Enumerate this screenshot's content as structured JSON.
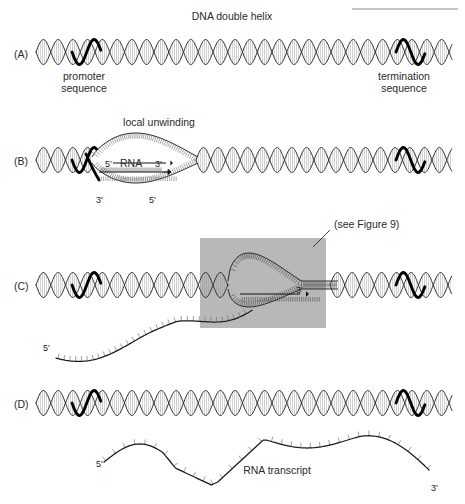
{
  "figure": {
    "title": "DNA double helix",
    "background_color": "#ffffff",
    "ink_color": "#2a2a2a",
    "highlight_color": "#000000",
    "callout_box_color": "#b8b8b8",
    "width": 465,
    "height": 504
  },
  "top_rule": {
    "present": true,
    "x1": 352,
    "x2": 458,
    "y": 9
  },
  "panels": [
    {
      "id": "A",
      "letter": "(A)",
      "letter_x": 14,
      "letter_y": 58,
      "helix_y": 52,
      "labels": [
        {
          "name": "promoter-sequence",
          "lines": [
            "promoter",
            "sequence"
          ],
          "x": 84,
          "y": 80
        },
        {
          "name": "termination-sequence",
          "lines": [
            "termination",
            "sequence"
          ],
          "x": 404,
          "y": 80
        }
      ]
    },
    {
      "id": "B",
      "letter": "(B)",
      "letter_x": 14,
      "letter_y": 165,
      "helix_y": 160,
      "labels": [
        {
          "name": "local-unwinding",
          "lines": [
            "local unwinding"
          ],
          "x": 159,
          "y": 126
        },
        {
          "name": "rna-5prime",
          "lines": [
            "5'"
          ],
          "x": 105,
          "y": 167
        },
        {
          "name": "rna-name",
          "lines": [
            "RNA"
          ],
          "x": 128,
          "y": 167
        },
        {
          "name": "rna-3prime",
          "lines": [
            "3'"
          ],
          "x": 157,
          "y": 167
        },
        {
          "name": "template-3prime",
          "lines": [
            "3'"
          ],
          "x": 98,
          "y": 201
        },
        {
          "name": "template-5prime",
          "lines": [
            "5'"
          ],
          "x": 151,
          "y": 201
        }
      ]
    },
    {
      "id": "C",
      "letter": "(C)",
      "letter_x": 14,
      "letter_y": 290,
      "helix_y": 285,
      "labels": [
        {
          "name": "see-figure-reference",
          "lines": [
            "(see Figure 9)"
          ],
          "x": 331,
          "y": 227
        },
        {
          "name": "rna-3prime-growing",
          "lines": [
            "3'"
          ],
          "x": 299,
          "y": 291
        },
        {
          "name": "rna-5prime-free-end",
          "lines": [
            "5'"
          ],
          "x": 46,
          "y": 349
        }
      ],
      "callout_box": {
        "x": 200,
        "y": 238,
        "width": 126,
        "height": 90
      }
    },
    {
      "id": "D",
      "letter": "(D)",
      "letter_x": 14,
      "letter_y": 408,
      "helix_y": 403,
      "labels": [
        {
          "name": "rna-transcript",
          "lines": [
            "RNA transcript"
          ],
          "x": 277,
          "y": 474
        },
        {
          "name": "transcript-5prime",
          "lines": [
            "5'"
          ],
          "x": 98,
          "y": 465
        },
        {
          "name": "transcript-3prime",
          "lines": [
            "3'"
          ],
          "x": 433,
          "y": 489
        }
      ]
    }
  ],
  "legend_terms": {
    "promoter": "promoter sequence",
    "termination": "termination sequence",
    "unwinding": "local unwinding",
    "transcript": "RNA transcript",
    "reference": "(see Figure 9)"
  }
}
